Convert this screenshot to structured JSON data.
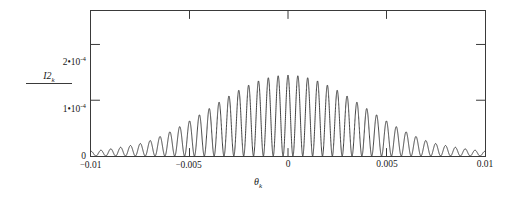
{
  "chart_data": {
    "type": "line",
    "title": "",
    "xlabel": "θ",
    "xlabel_sub": "k",
    "ylabel": "I2",
    "ylabel_sub": "k",
    "xlim": [
      -0.01,
      0.01
    ],
    "ylim": [
      0,
      0.00026
    ],
    "grid": false,
    "legend": null,
    "xticks": [
      -0.01,
      -0.005,
      0,
      0.005,
      0.01
    ],
    "xticklabels": [
      "-0.01",
      "-0.005",
      "0",
      "0.005",
      "0.01"
    ],
    "yticks": [
      0,
      0.0001,
      0.0002
    ],
    "yticklabels": [
      "0",
      "1·10⁻⁴",
      "2·10⁻⁴"
    ],
    "ytick_parts": [
      {
        "mantissa": "0",
        "dot": "",
        "base": "",
        "exp": ""
      },
      {
        "mantissa": "1",
        "dot": "•",
        "base": "10",
        "exp": "-4"
      },
      {
        "mantissa": "2",
        "dot": "•",
        "base": "10",
        "exp": "-4"
      }
    ],
    "envelope_peak": 0.000145,
    "fringe_period": 0.0005,
    "n_fringes": 40,
    "series": [
      {
        "name": "I2_k",
        "color": "#2b2b2b",
        "linewidth": 0.9,
        "model": {
          "kind": "interference_envelope",
          "amplitude": 0.000145,
          "envelope_sigma": 0.0047,
          "envelope_form": "gaussian-like sinc2 lobe",
          "fringe_frequency_per_unit_theta": 2000,
          "center": 0
        },
        "sample_peaks_theta": [
          -0.0095,
          -0.009,
          -0.0085,
          -0.008,
          -0.0075,
          -0.007,
          -0.0065,
          -0.006,
          -0.0055,
          -0.005,
          -0.0045,
          -0.004,
          -0.0035,
          -0.003,
          -0.0025,
          -0.002,
          -0.0015,
          -0.001,
          -0.0005,
          0.0,
          0.0005,
          0.001,
          0.0015,
          0.002,
          0.0025,
          0.003,
          0.0035,
          0.004,
          0.0045,
          0.005,
          0.0055,
          0.006,
          0.0065,
          0.007,
          0.0075,
          0.008,
          0.0085,
          0.009,
          0.0095
        ],
        "sample_peaks_value": [
          2.8e-06,
          5.5e-06,
          8.5e-06,
          1.2e-05,
          1.6e-05,
          2.1e-05,
          2.7e-05,
          3.4e-05,
          4.2e-05,
          5.1e-05,
          6.1e-05,
          7.2e-05,
          8.3e-05,
          9.5e-05,
          0.000106,
          0.000116,
          0.000126,
          0.000134,
          0.000141,
          0.000145,
          0.000144,
          0.000139,
          0.000132,
          0.000122,
          0.000111,
          9.9e-05,
          8.7e-05,
          7.6e-05,
          6.5e-05,
          5.5e-05,
          4.5e-05,
          3.7e-05,
          2.9e-05,
          2.3e-05,
          1.75e-05,
          1.3e-05,
          9.3e-06,
          6.2e-06,
          3.7e-06
        ]
      }
    ]
  }
}
